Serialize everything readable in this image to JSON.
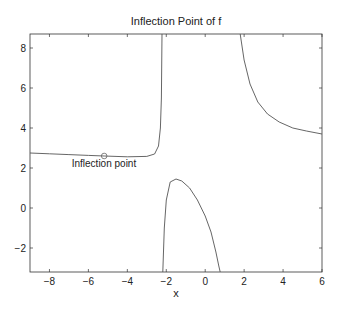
{
  "chart_data": {
    "type": "line",
    "title": "Inflection Point of f",
    "xlabel": "x",
    "ylabel": "",
    "xlim": [
      -9,
      6
    ],
    "ylim": [
      -3.2,
      8.7
    ],
    "xticks": [
      -8,
      -6,
      -4,
      -2,
      0,
      2,
      4,
      6
    ],
    "yticks": [
      -2,
      0,
      2,
      4,
      6,
      8
    ],
    "grid": false,
    "legend": null,
    "annotations": [
      {
        "text": "Inflection point",
        "x": -5.2,
        "y": 2.05
      }
    ],
    "markers": [
      {
        "shape": "circle",
        "x": -5.19,
        "y": 2.6
      }
    ],
    "series": [
      {
        "name": "f branch left",
        "x": [
          -9,
          -8,
          -7,
          -6,
          -5.19,
          -4,
          -3,
          -2.6,
          -2.4,
          -2.3,
          -2.25,
          -2.22
        ],
        "y": [
          2.75,
          2.71,
          2.67,
          2.63,
          2.6,
          2.56,
          2.58,
          2.7,
          3.1,
          4.0,
          5.5,
          8.7
        ]
      },
      {
        "name": "f branch middle",
        "x": [
          -2.18,
          -2.1,
          -2.0,
          -1.8,
          -1.5,
          -1.2,
          -0.8,
          -0.4,
          0,
          0.3,
          0.55,
          0.7,
          0.77
        ],
        "y": [
          -3.2,
          -1.0,
          0.4,
          1.3,
          1.45,
          1.35,
          1.0,
          0.4,
          -0.4,
          -1.2,
          -2.2,
          -2.9,
          -3.2
        ]
      },
      {
        "name": "f branch right",
        "x": [
          1.8,
          2.0,
          2.3,
          2.7,
          3.2,
          3.8,
          4.5,
          5.2,
          6.0
        ],
        "y": [
          8.7,
          7.4,
          6.2,
          5.3,
          4.7,
          4.3,
          4.0,
          3.85,
          3.7
        ]
      }
    ]
  }
}
